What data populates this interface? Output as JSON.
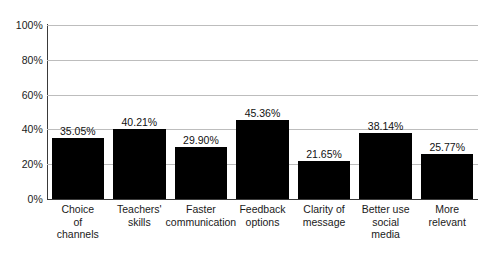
{
  "chart_data": {
    "type": "bar",
    "title": "",
    "subtitle": "",
    "xlabel": "",
    "ylabel": "",
    "ylim": [
      0,
      100
    ],
    "ytick_labels": [
      "0%",
      "20%",
      "40%",
      "60%",
      "80%",
      "100%"
    ],
    "ytick_values": [
      0,
      20,
      40,
      60,
      80,
      100
    ],
    "grid": "horizontal",
    "legend": "none",
    "bar_color": "#000000",
    "gridline_color": "#bdbdbd",
    "axis_color": "#3a3a3a",
    "categories": [
      "Choice of channels",
      "Teachers' skills",
      "Faster communication",
      "Feedback options",
      "Clarity of message",
      "Better use social media",
      "More relevant"
    ],
    "category_lines": [
      [
        "Choice",
        "of",
        "channels"
      ],
      [
        "Teachers'",
        "skills"
      ],
      [
        "Faster",
        "communication"
      ],
      [
        "Feedback",
        "options"
      ],
      [
        "Clarity of",
        "message"
      ],
      [
        "Better use",
        "social",
        "media"
      ],
      [
        "More",
        "relevant"
      ]
    ],
    "values": [
      35.05,
      40.21,
      29.9,
      45.36,
      21.65,
      38.14,
      25.77
    ],
    "data_labels": [
      "35.05%",
      "40.21%",
      "29.90%",
      "45.36%",
      "21.65%",
      "38.14%",
      "25.77%"
    ]
  }
}
